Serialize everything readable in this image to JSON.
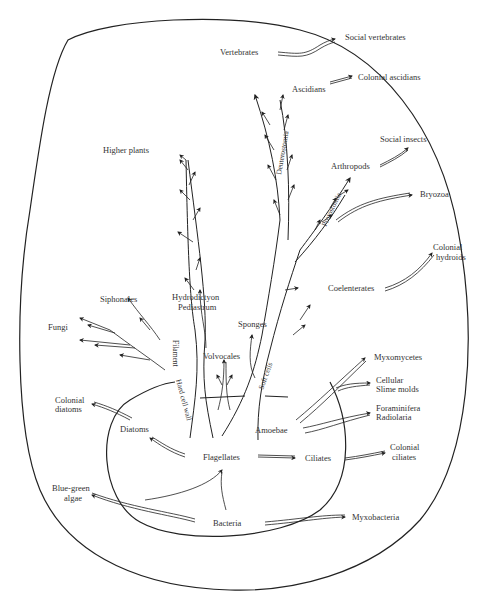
{
  "diagram": {
    "title": "",
    "labels": {
      "social_vertebrates": "Social vertebrates",
      "vertebrates": "Vertebrates",
      "colonial_ascidians": "Colonial ascidians",
      "ascidians": "Ascidians",
      "social_insects": "Social insects",
      "higher_plants": "Higher plants",
      "arthropods": "Arthropods",
      "bryozoa": "Bryozoa",
      "colonial_hydroids_1": "Colonial",
      "colonial_hydroids_2": "hydroids",
      "coelenterates": "Coelenterates",
      "siphonales": "Siphonales",
      "hydrodictyon": "Hydrodictyon",
      "pediastrum": "Pediastrum",
      "fungi": "Fungi",
      "sponges": "Sponges",
      "volvocales": "Volvocales",
      "myxomycetes": "Myxomycetes",
      "cellular_slime_molds_1": "Cellular",
      "cellular_slime_molds_2": "Slime molds",
      "foraminifera": "Foraminifera",
      "radiolaria": "Radiolaria",
      "colonial_diatoms_1": "Colonial",
      "colonial_diatoms_2": "diatoms",
      "diatoms": "Diatoms",
      "amoebae": "Amoebae",
      "flagellates": "Flagellates",
      "ciliates": "Ciliates",
      "colonial_ciliates_1": "Colonial",
      "colonial_ciliates_2": "ciliates",
      "blue_green_algae_1": "Blue-green",
      "blue_green_algae_2": "algae",
      "bacteria": "Bacteria",
      "myxobacteria": "Myxobacteria"
    },
    "branch_labels": {
      "deuterostomia": "Deuterostomia",
      "protostomia": "Protostomia",
      "filament": "Filament",
      "hard_cell_wall": "Hard cell wall",
      "soft_cells": "Soft cells"
    }
  }
}
